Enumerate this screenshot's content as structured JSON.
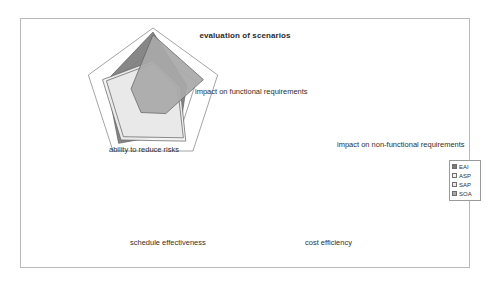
{
  "chart_data": {
    "type": "radar",
    "title": "evaluation of scenarios",
    "xlabel": "",
    "ylabel": "",
    "grid": true,
    "grid_rings": 3,
    "legend_position": "right",
    "axis_max": 5,
    "categories": [
      "impact on functional requirements",
      "impact on non-functional requirements",
      "cost efficiency",
      "schedule effectiveness",
      "ability to reduce risks"
    ],
    "series": [
      {
        "name": "EAI",
        "color": "#7d7d7d",
        "values": [
          4.7,
          2.6,
          3.3,
          4.3,
          3.6
        ]
      },
      {
        "name": "ASP",
        "color": "#f2f2f2",
        "values": [
          2.6,
          2.1,
          4.1,
          4.0,
          3.9
        ]
      },
      {
        "name": "SAP",
        "color": "#e8e8e8",
        "values": [
          2.4,
          1.9,
          3.8,
          3.7,
          3.6
        ]
      },
      {
        "name": "SOA",
        "color": "#a8a8a8",
        "values": [
          4.5,
          3.9,
          1.6,
          1.5,
          1.7
        ]
      }
    ]
  },
  "legend": {
    "items": [
      {
        "label": "EAI"
      },
      {
        "label": "ASP"
      },
      {
        "label": "SAP"
      },
      {
        "label": "SOA"
      }
    ]
  },
  "axis_labels": {
    "top": "impact on functional requirements",
    "right": "impact on non-functional requirements",
    "left": "ability to reduce risks",
    "bottom_left": "schedule effectiveness",
    "bottom_right": "cost efficiency"
  }
}
